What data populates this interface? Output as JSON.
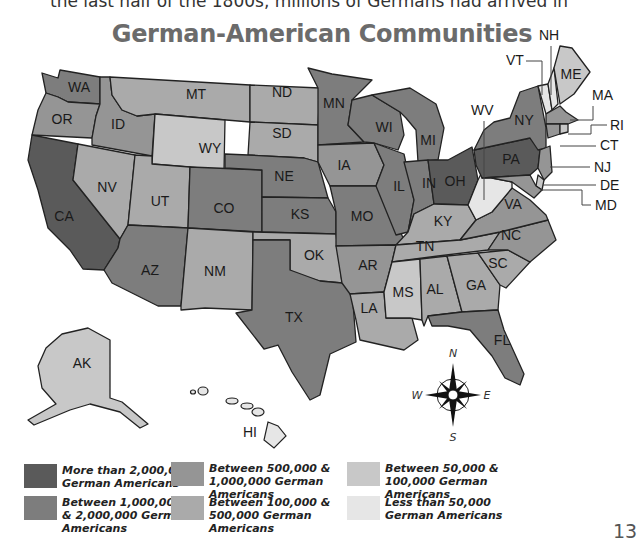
{
  "intro_text": "the last half of the 1800s, millions of Germans had arrived in",
  "title": "German-American Communities",
  "page_number": "13",
  "colors": {
    "tier1": "#5a5a5a",
    "tier2": "#7d7d7d",
    "tier3": "#959595",
    "tier4": "#aaaaaa",
    "tier5": "#c8c8c8",
    "tier6": "#e6e6e6"
  },
  "legend": [
    {
      "tier": "tier1",
      "label": "More than 2,000,000 German Americans"
    },
    {
      "tier": "tier2",
      "label": "Between 1,000,000 & 2,000,000 German Americans"
    },
    {
      "tier": "tier3",
      "label": "Between 500,000 & 1,000,000 German Americans"
    },
    {
      "tier": "tier4",
      "label": "Between 100,000 & 500,000 German Americans"
    },
    {
      "tier": "tier5",
      "label": "Between 50,000 & 100,000 German Americans"
    },
    {
      "tier": "tier6",
      "label": "Less than 50,000 German Americans"
    }
  ],
  "compass": {
    "n": "N",
    "s": "S",
    "e": "E",
    "w": "W"
  },
  "states": {
    "WA": "WA",
    "OR": "OR",
    "CA": "CA",
    "ID": "ID",
    "NV": "NV",
    "MT": "MT",
    "WY": "WY",
    "UT": "UT",
    "AZ": "AZ",
    "CO": "CO",
    "NM": "NM",
    "ND": "ND",
    "SD": "SD",
    "NE": "NE",
    "KS": "KS",
    "OK": "OK",
    "TX": "TX",
    "MN": "MN",
    "IA": "IA",
    "MO": "MO",
    "AR": "AR",
    "LA": "LA",
    "WI": "WI",
    "IL": "IL",
    "MI": "MI",
    "IN": "IN",
    "OH": "OH",
    "KY": "KY",
    "TN": "TN",
    "MS": "MS",
    "AL": "AL",
    "GA": "GA",
    "FL": "FL",
    "SC": "SC",
    "NC": "NC",
    "VA": "VA",
    "WV": "WV",
    "PA": "PA",
    "NY": "NY",
    "VT": "VT",
    "NH": "NH",
    "ME": "ME",
    "MA": "MA",
    "RI": "RI",
    "CT": "CT",
    "NJ": "NJ",
    "DE": "DE",
    "MD": "MD",
    "AK": "AK",
    "HI": "HI"
  }
}
